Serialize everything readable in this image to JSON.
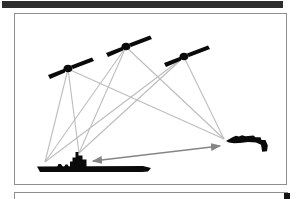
{
  "window": {
    "width": 300,
    "height": 199,
    "background": "#ffffff"
  },
  "top_bar": {
    "color": "#2d2d2d"
  },
  "main_panel": {
    "border_color": "#8f8f8f",
    "background": "#ffffff"
  },
  "bottom_panel": {
    "border_color": "#8f8f8f",
    "corner_mark_color": "#141414"
  },
  "diagram": {
    "silhouette_color": "#0a0a0a",
    "signal_line_color": "#bdbdbd",
    "signal_line_width": 1.1,
    "datalink_color": "#858585",
    "datalink_width": 1.6,
    "satellites": [
      {
        "id": "satellite-1",
        "x": 68,
        "y": 66
      },
      {
        "id": "satellite-2",
        "x": 126,
        "y": 44
      },
      {
        "id": "satellite-3",
        "x": 184,
        "y": 54
      }
    ],
    "ship": {
      "id": "aircraft-carrier",
      "x": 38,
      "y": 172
    },
    "aircraft": {
      "id": "jet-aircraft",
      "x": 226,
      "y": 141
    },
    "points": {
      "satellite-1": [
        68,
        69
      ],
      "satellite-2": [
        126,
        47
      ],
      "satellite-3": [
        184,
        57
      ],
      "ship-bow": [
        45,
        162
      ],
      "ship-island": [
        79,
        153
      ],
      "aircraft-receiver": [
        224,
        139
      ]
    },
    "signal_links": [
      [
        "satellite-1",
        "ship-bow"
      ],
      [
        "satellite-1",
        "ship-island"
      ],
      [
        "satellite-1",
        "aircraft-receiver"
      ],
      [
        "satellite-2",
        "ship-bow"
      ],
      [
        "satellite-2",
        "ship-island"
      ],
      [
        "satellite-2",
        "aircraft-receiver"
      ],
      [
        "satellite-3",
        "ship-bow"
      ],
      [
        "satellite-3",
        "ship-island"
      ],
      [
        "satellite-3",
        "aircraft-receiver"
      ]
    ],
    "datalink": {
      "from": [
        93,
        161
      ],
      "to": [
        220,
        146
      ],
      "double_arrow": true
    }
  }
}
